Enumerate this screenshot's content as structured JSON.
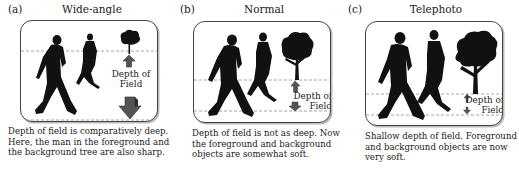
{
  "figure": {
    "panels": [
      {
        "letter": "(a)",
        "title": "Wide-angle",
        "dof_label_line1": "Depth of",
        "dof_label_line2": "Field",
        "caption_lines": [
          "Depth of field is comparatively deep.",
          "Here, the man in the foreground and",
          "the background tree are also sharp."
        ]
      },
      {
        "letter": "(b)",
        "title": "Normal",
        "dof_label_line1": "Depth of",
        "dof_label_line2": "Field",
        "caption_lines": [
          "Depth of field is not as deep. Now",
          "the foreground and background",
          "objects are somewhat soft."
        ]
      },
      {
        "letter": "(c)",
        "title": "Telephoto",
        "dof_label_line1": "Depth of",
        "dof_label_line2": "Field",
        "caption_lines": [
          "Shallow depth of field. Foreground",
          "and background objects are now",
          "very soft."
        ]
      }
    ],
    "colors": {
      "silhouette": "#111111",
      "frame": "#444444",
      "dashed_line": "#9a9a9a",
      "arrow": "#555555",
      "arrow_shade": "#2e2e2e"
    }
  }
}
